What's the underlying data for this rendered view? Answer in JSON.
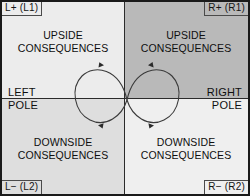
{
  "diagram": {
    "quadrants": [
      {
        "id": "top-left",
        "corner_label": "L+ (L1)",
        "line1": "UPSIDE",
        "line2": "CONSEQUENCES",
        "fill": "#ececec"
      },
      {
        "id": "top-right",
        "corner_label": "R+ (R1)",
        "line1": "UPSIDE",
        "line2": "CONSEQUENCES",
        "fill": "#b9b9b9"
      },
      {
        "id": "bottom-left",
        "corner_label": "L− (L2)",
        "line1": "DOWNSIDE",
        "line2": "CONSEQUENCES",
        "fill": "#dedede"
      },
      {
        "id": "bottom-right",
        "corner_label": "R− (R2)",
        "line1": "DOWNSIDE",
        "line2": "CONSEQUENCES",
        "fill": "#efefef"
      }
    ],
    "poles": {
      "left_top": "LEFT",
      "left_bottom": "POLE",
      "right_top": "RIGHT",
      "right_bottom": "POLE"
    },
    "colors": {
      "border": "#1a1a1a",
      "axis": "#2b2b2b",
      "loop": "#3a3a3a",
      "text": "#0f0f0f"
    },
    "infinity_loop": {
      "name": "infinity-loop",
      "arrow_count": 4,
      "direction": "continuous-figure-eight"
    }
  }
}
